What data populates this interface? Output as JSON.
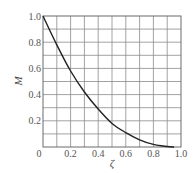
{
  "chart_data": {
    "type": "line",
    "title": "",
    "xlabel": "ζ",
    "ylabel": "M",
    "xlim": [
      0,
      1.0
    ],
    "ylim": [
      0,
      1.0
    ],
    "grid": true,
    "grid_divisions": {
      "x": 10,
      "y": 10
    },
    "x_ticks": [
      "0",
      "0.2",
      "0.4",
      "0.6",
      "0.8",
      "1.0"
    ],
    "y_ticks": [
      "0",
      "0.2",
      "0.4",
      "0.6",
      "0.8",
      "1.0"
    ],
    "legend": null,
    "series": [
      {
        "name": "M(ζ)",
        "x": [
          0,
          0.1,
          0.2,
          0.3,
          0.4,
          0.5,
          0.6,
          0.7,
          0.8,
          0.9,
          0.95
        ],
        "y": [
          1.0,
          0.78,
          0.58,
          0.42,
          0.29,
          0.18,
          0.11,
          0.055,
          0.02,
          0.004,
          0.0
        ]
      }
    ]
  },
  "colors": {
    "curve": "#222222",
    "grid": "#8a8a8a",
    "text": "#555555"
  }
}
